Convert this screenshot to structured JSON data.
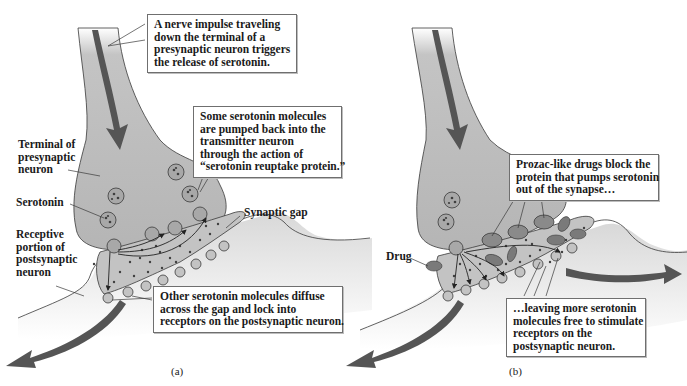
{
  "figure": {
    "colors": {
      "neuron_fill": "#b9b9b9",
      "neuron_light": "#dcdcdc",
      "outline": "#3a3a3a",
      "arrow": "#555555",
      "dot": "#4a4a4a",
      "drug": "#7a7a7a"
    },
    "panels": [
      {
        "id": "a",
        "caption": "(a)",
        "labels": {
          "terminal": [
            "Terminal of",
            "presynaptic",
            "neuron"
          ],
          "serotonin": "Serotonin",
          "receptive": [
            "Receptive",
            "portion of",
            "postsynaptic",
            "neuron"
          ],
          "synaptic_gap": "Synaptic gap"
        },
        "callouts": {
          "impulse": [
            "A nerve impulse traveling",
            "down the terminal of a",
            "presynaptic neuron triggers",
            "the release of serotonin."
          ],
          "reuptake": [
            "Some serotonin molecules",
            "are pumped back into the",
            "transmitter neuron",
            "through the action of",
            "“serotonin reuptake protein.”"
          ],
          "diffuse": [
            "Other serotonin molecules diffuse",
            "across the gap and lock into",
            "receptors on the postsynaptic neuron."
          ]
        }
      },
      {
        "id": "b",
        "caption": "(b)",
        "labels": {
          "drug": "Drug"
        },
        "callouts": {
          "block": [
            "Prozac-like drugs block the",
            "protein that pumps serotonin",
            "out of the synapse…"
          ],
          "leaving": [
            "…leaving more serotonin",
            "molecules free to stimulate",
            "receptors on the",
            "postsynaptic neuron."
          ]
        }
      }
    ]
  }
}
